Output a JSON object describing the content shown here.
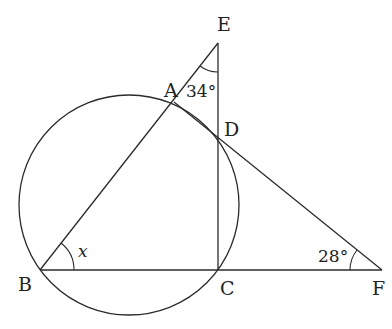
{
  "diagram": {
    "type": "geometry",
    "points": {
      "A": {
        "label": "A",
        "x": 174,
        "y": 102
      },
      "B": {
        "label": "B",
        "x": 40,
        "y": 270
      },
      "C": {
        "label": "C",
        "x": 218,
        "y": 270
      },
      "D": {
        "label": "D",
        "x": 218,
        "y": 139
      },
      "E": {
        "label": "E",
        "x": 218,
        "y": 43
      },
      "F": {
        "label": "F",
        "x": 382,
        "y": 270
      }
    },
    "circle": {
      "cx": 129,
      "cy": 205,
      "r": 110
    },
    "angles": {
      "E": {
        "label": "34°",
        "vertex": "E"
      },
      "F": {
        "label": "28°",
        "vertex": "F"
      },
      "B": {
        "label": "x",
        "vertex": "B"
      }
    },
    "stroke_color": "#2b2b2b"
  }
}
